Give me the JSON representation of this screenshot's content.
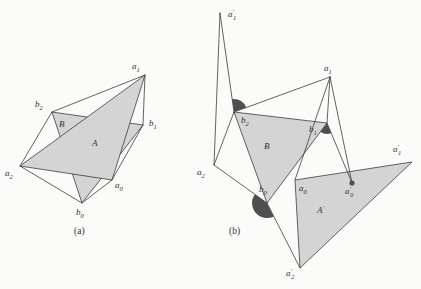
{
  "figure": {
    "width": 421,
    "height": 289,
    "background": "#fbfbfa",
    "shade_color": "#d4d4d4",
    "wedge_color": "#4f4f4f",
    "line_color": "#3c3c3c",
    "line_width": 0.8,
    "panels": [
      {
        "id": "a",
        "caption": {
          "text": "(a)",
          "x": 74,
          "y": 234
        },
        "vertices": {
          "a0": [
            112,
            180
          ],
          "a1": [
            145,
            75
          ],
          "a2": [
            20,
            166
          ],
          "b0": [
            82,
            203
          ],
          "b1": [
            143,
            125
          ],
          "b2": [
            52,
            112
          ]
        },
        "polygons": [
          {
            "name": "triangle-B",
            "pts": [
              "b0",
              "b1",
              "b2"
            ],
            "label": {
              "t": "B",
              "x": 59,
              "y": 127
            }
          },
          {
            "name": "triangle-A",
            "pts": [
              "a0",
              "a1",
              "a2"
            ],
            "label": {
              "t": "A",
              "x": 92,
              "y": 146
            }
          }
        ],
        "segments": [
          [
            "a1",
            "b2"
          ],
          [
            "b2",
            "a2"
          ],
          [
            "a2",
            "b0"
          ],
          [
            "b0",
            "a0"
          ],
          [
            "a0",
            "b1"
          ],
          [
            "b1",
            "a1"
          ]
        ],
        "wedges": [],
        "dots": [],
        "labels": [
          {
            "t": "a",
            "s": "1",
            "x": 132,
            "y": 69
          },
          {
            "t": "b",
            "s": "2",
            "x": 35,
            "y": 107
          },
          {
            "t": "b",
            "s": "1",
            "x": 149,
            "y": 126
          },
          {
            "t": "a",
            "s": "2",
            "x": 5,
            "y": 176
          },
          {
            "t": "a",
            "s": "0",
            "x": 115,
            "y": 188
          },
          {
            "t": "b",
            "s": "0",
            "x": 76,
            "y": 215
          }
        ]
      },
      {
        "id": "b",
        "caption": {
          "text": "(b)",
          "x": 229,
          "y": 234
        },
        "vertices": {
          "T": [
            220,
            13
          ],
          "a1": [
            330,
            77
          ],
          "b2": [
            234,
            112
          ],
          "b1": [
            327,
            123
          ],
          "a2": [
            214,
            165
          ],
          "a0": [
            295,
            180
          ],
          "ap0": [
            352,
            183
          ],
          "b0": [
            267,
            203
          ],
          "ap2": [
            300,
            268
          ],
          "ap1": [
            412,
            162
          ]
        },
        "polygons": [
          {
            "name": "triangle-B",
            "pts": [
              "b0",
              "b1",
              "b2"
            ],
            "label": {
              "t": "B",
              "x": 264,
              "y": 149
            }
          },
          {
            "name": "triangle-A-prime",
            "pts": [
              "a0",
              "ap1",
              "ap2"
            ],
            "label": {
              "t": "A",
              "p": "′",
              "x": 317,
              "y": 213
            }
          }
        ],
        "segments": [
          [
            "T",
            "a2"
          ],
          [
            "T",
            "b2"
          ],
          [
            "a2",
            "b2"
          ],
          [
            "a2",
            "b0"
          ],
          [
            "b2",
            "a1"
          ],
          [
            "a1",
            "b1"
          ],
          [
            "a1",
            "ap0"
          ],
          [
            "b1",
            "ap0"
          ],
          [
            "a1",
            "a0"
          ],
          [
            "b0",
            "ap2"
          ]
        ],
        "wedges": [
          {
            "at": "b2",
            "r": 13,
            "a1": -98,
            "a2": -20
          },
          {
            "at": "b1",
            "r": 11,
            "a1": 67,
            "a2": 127
          },
          {
            "at": "b0",
            "r": 15,
            "a1": 63,
            "a2": 216
          }
        ],
        "dots": [
          {
            "at": "ap0",
            "r": 2.6
          }
        ],
        "labels": [
          {
            "t": "a",
            "p": "′",
            "s": "1",
            "x": 228,
            "y": 17
          },
          {
            "t": "a",
            "s": "1",
            "x": 324,
            "y": 71
          },
          {
            "t": "b",
            "s": "2",
            "x": 241,
            "y": 123
          },
          {
            "t": "b",
            "s": "1",
            "x": 309,
            "y": 132
          },
          {
            "t": "a",
            "s": "2",
            "x": 197,
            "y": 175
          },
          {
            "t": "a",
            "s": "0",
            "x": 299,
            "y": 191
          },
          {
            "t": "a",
            "p": "′",
            "s": "0",
            "x": 345,
            "y": 194
          },
          {
            "t": "b",
            "s": "0",
            "x": 259,
            "y": 192
          },
          {
            "t": "a",
            "p": "′",
            "s": "2",
            "x": 286,
            "y": 276
          },
          {
            "t": "a",
            "p": "′",
            "s": "1",
            "x": 393,
            "y": 152
          }
        ]
      }
    ]
  }
}
